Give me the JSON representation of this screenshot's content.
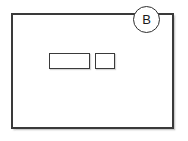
{
  "figure": {
    "type": "technical-line-drawing",
    "background_color": "#ffffff",
    "line_color": "#3a3a3a",
    "outer_frame": {
      "name": "enclosure-outline",
      "label": ""
    },
    "callout": {
      "name": "reference-callout",
      "letter": "B",
      "shape": "circle",
      "position": "top-right",
      "stroke_color": "#2e2e2e",
      "text_color": "#1a1a1a"
    },
    "elements": [
      {
        "name": "wide-rectangle",
        "label": "",
        "width_px": 41,
        "height_px": 16
      },
      {
        "name": "narrow-rectangle",
        "label": "",
        "width_px": 20,
        "height_px": 16
      }
    ]
  }
}
